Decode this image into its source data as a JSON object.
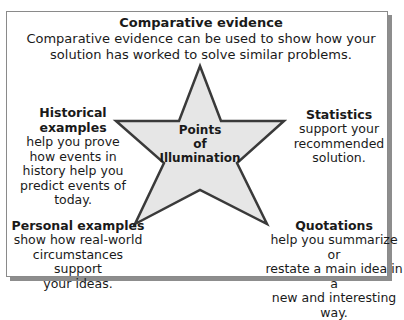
{
  "diagram": {
    "center": {
      "label_lines": [
        "Points",
        "of",
        "Illumination"
      ],
      "fill": "#e6e6e6",
      "stroke": "#3a3a3a"
    },
    "top": {
      "title": "Comparative evidence",
      "body_lines": [
        "Comparative evidence can be used to show how your",
        "solution has worked to solve similar problems."
      ]
    },
    "left": {
      "title": "Historical examples",
      "body_lines": [
        "help you prove",
        "how events in",
        "history help you",
        "predict events of",
        "today."
      ]
    },
    "right": {
      "title": "Statistics",
      "body_lines": [
        "support your",
        "recommended",
        "solution."
      ]
    },
    "bottom_left": {
      "title": "Personal examples",
      "body_lines": [
        "show how real-world",
        "circumstances support",
        "your ideas."
      ]
    },
    "bottom_right": {
      "title": "Quotations",
      "body_lines": [
        "help you summarize or",
        "restate a main idea in a",
        "new and interesting way."
      ]
    }
  }
}
